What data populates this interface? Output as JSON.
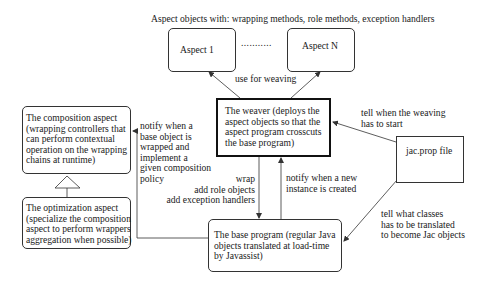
{
  "diagram": {
    "header": "Aspect objects with: wrapping methods, role methods, exception handlers",
    "nodes": {
      "aspect1": {
        "label": "Aspect 1"
      },
      "aspectN": {
        "label": "Aspect N"
      },
      "ellipsis": {
        "label": "..........."
      },
      "weaver": {
        "label": "The weaver (deploys the\naspect objects so that the\naspect program crosscuts\nthe base program)"
      },
      "composition": {
        "label": "The composition aspect\n(wrapping controllers that\ncan perform contextual\noperation on the wrapping\nchains at runtime)"
      },
      "optimization": {
        "label": "The optimization aspect\n(specialize the composition\naspect to perform wrappers\naggregation when possible)"
      },
      "base": {
        "label": "The base program (regular Java\nobjects translated at load-time\nby Javassist)"
      },
      "jacprop": {
        "label": "jac.prop file"
      }
    },
    "edges": {
      "use_for_weaving": "use for weaving",
      "notify_wrapped": "notify when a\nbase object is\nwrapped and\nimplement a\ngiven composition\npolicy",
      "wrap": "wrap\nadd role objects\nadd exception handlers",
      "notify_instance": "notify when a new\ninstance is created",
      "tell_start": "tell when the weaving\nhas to start",
      "tell_classes": "tell what classes\nhas to be translated\nto become Jac objects"
    },
    "colors": {
      "line": "#333333",
      "text": "#1a1a1a",
      "background": "#ffffff"
    }
  }
}
